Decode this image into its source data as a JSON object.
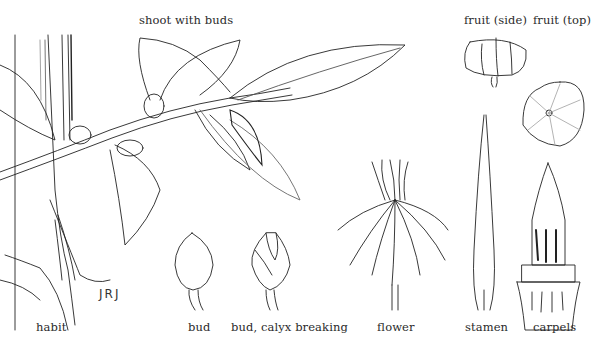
{
  "plate": {
    "labels": {
      "shoot": "shoot with buds",
      "fruit_side": "fruit (side)",
      "fruit_top": "fruit (top)",
      "habit": "habit",
      "bud": "bud",
      "bud_calyx": "bud, calyx breaking",
      "flower": "flower",
      "stamen": "stamen",
      "carpels": "carpels"
    },
    "signature": "JRJ",
    "ink_color": "#222222",
    "paper_color": "#ffffff"
  }
}
